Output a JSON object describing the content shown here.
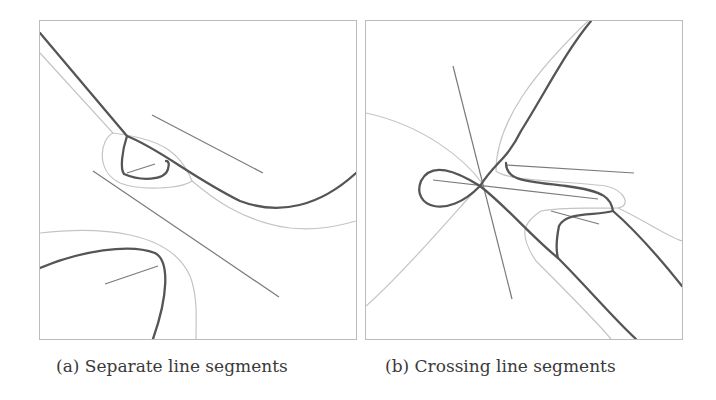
{
  "figure": {
    "panels": [
      {
        "id": "a",
        "caption": "(a) Separate line segments",
        "line_segments": 4,
        "description": "Offset curves around four disjoint line segments"
      },
      {
        "id": "b",
        "caption": "(b) Crossing line segments",
        "line_segments": 4,
        "description": "Offset curves around line segments crossing at a common point, forming a loop"
      }
    ],
    "colors": {
      "thick_curve": "#555555",
      "thin_curve": "#c4c4c4",
      "segment": "#7a7a7a",
      "frame": "#bcbcbc"
    }
  }
}
